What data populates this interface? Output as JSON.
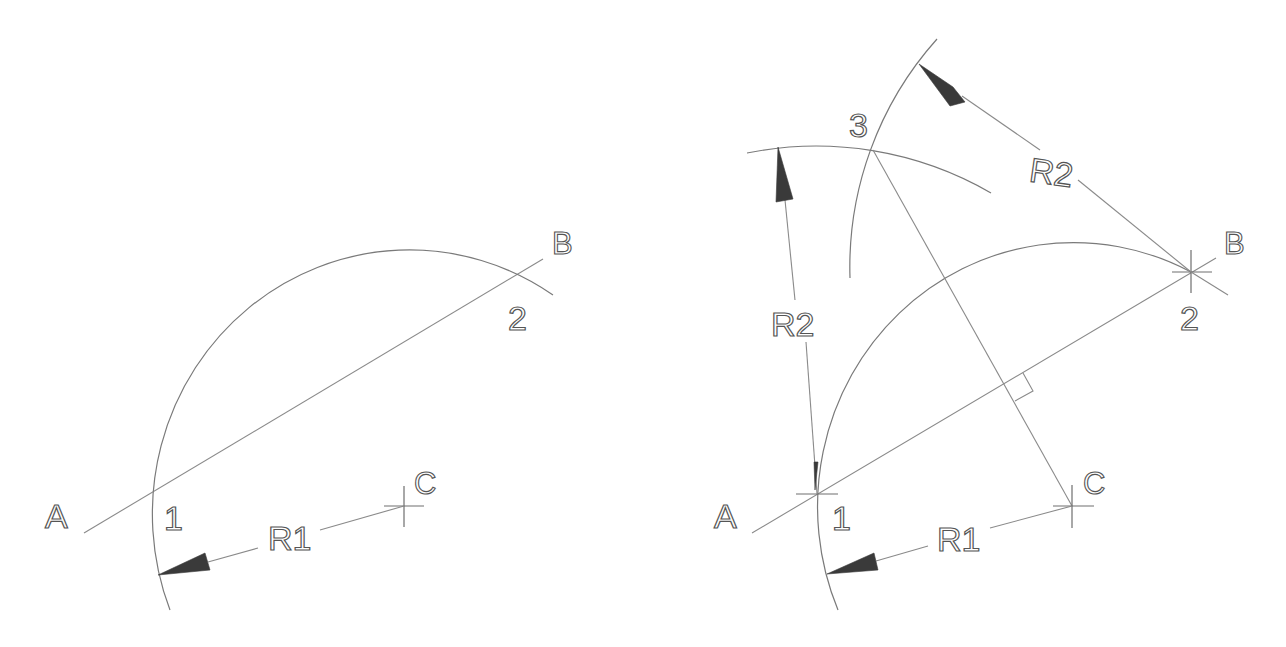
{
  "figure": {
    "panels": [
      {
        "id": "left",
        "labels": {
          "A": "A",
          "B": "B",
          "C": "C",
          "p1": "1",
          "p2": "2",
          "R1": "R1"
        }
      },
      {
        "id": "right",
        "labels": {
          "A": "A",
          "B": "B",
          "C": "C",
          "p1": "1",
          "p2": "2",
          "p3": "3",
          "R1": "R1",
          "R2_left": "R2",
          "R2_top": "R2"
        }
      }
    ],
    "colors": {
      "background": "#ffffff",
      "line": "#8a8a8a",
      "arrowhead": "#3a3a3a",
      "text": "#555555"
    }
  }
}
